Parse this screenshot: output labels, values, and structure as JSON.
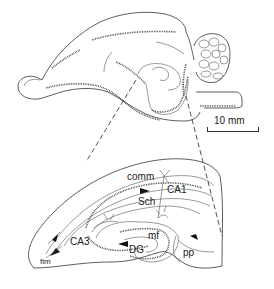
{
  "figure": {
    "scale_bar": {
      "label": "10 mm"
    },
    "labels": {
      "comm": "comm",
      "ca1": "CA1",
      "sch": "Sch",
      "mf": "mf",
      "ca3": "CA3",
      "dg": "DG",
      "fim": "fim",
      "pp": "pp"
    },
    "colors": {
      "line": "#333333",
      "background": "#ffffff"
    }
  }
}
